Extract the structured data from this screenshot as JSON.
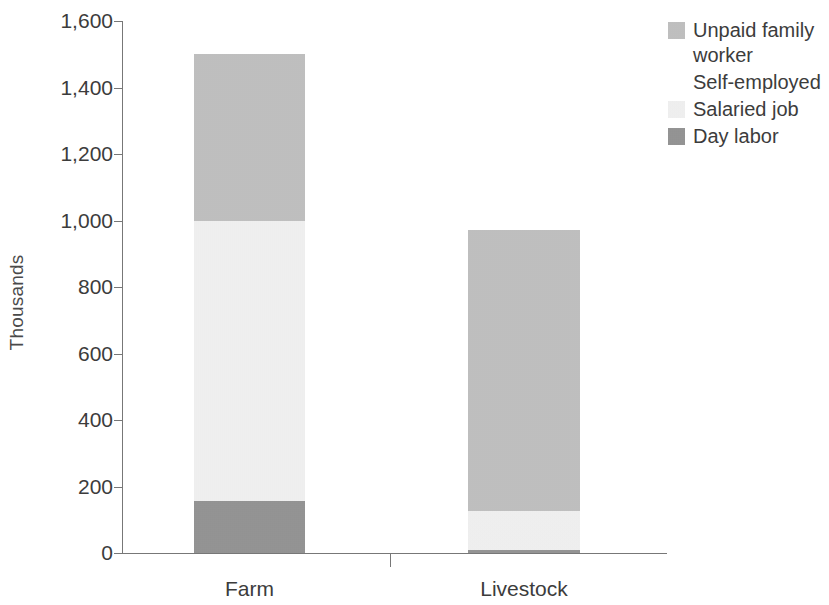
{
  "chart_data": {
    "type": "bar",
    "subtype": "stacked-vertical",
    "title": "",
    "subtitle": "",
    "xlabel": "",
    "ylabel": "Thousands",
    "categories": [
      "Farm",
      "Livestock"
    ],
    "series": [
      {
        "name": "Unpaid family worker",
        "color": "#bdbdbd",
        "values": [
          500,
          845
        ]
      },
      {
        "name": "Self-employed",
        "color": "#ffffff",
        "values": [
          0,
          0
        ]
      },
      {
        "name": "Salaried job",
        "color": "#f4f4f4",
        "values": [
          845,
          115
        ]
      },
      {
        "name": "Day labor",
        "color": "#8c8c8c",
        "values": [
          155,
          10
        ]
      }
    ],
    "stack_order_bottom_to_top": [
      "Day labor",
      "Salaried job",
      "Self-employed",
      "Unpaid family worker"
    ],
    "totals": [
      1500,
      970
    ],
    "segment_boundaries": {
      "Farm": [
        0,
        155,
        1000,
        1000,
        1500
      ],
      "Livestock": [
        0,
        10,
        125,
        125,
        970
      ]
    },
    "ylim": [
      0,
      1600
    ],
    "yticks": [
      0,
      200,
      400,
      600,
      800,
      1000,
      1200,
      1400,
      1600
    ],
    "ytick_labels": [
      "0",
      "200",
      "400",
      "600",
      "800",
      "1,000",
      "1,200",
      "1,400",
      "1,600"
    ],
    "grid": false,
    "legend_position": "right-top",
    "axis_color": "#777777",
    "text_color": "#3c3c3c",
    "background": "#ffffff"
  },
  "legend": {
    "items": [
      {
        "label": "Unpaid family\nworker",
        "swatch": "#bdbdbd",
        "swatch_visible": true
      },
      {
        "label": "Self-employed",
        "swatch": "#ffffff",
        "swatch_visible": false
      },
      {
        "label": "Salaried job",
        "swatch": "#f4f4f4",
        "swatch_visible": true
      },
      {
        "label": "Day labor",
        "swatch": "#8c8c8c",
        "swatch_visible": true
      }
    ]
  },
  "axis": {
    "y_title": "Thousands"
  }
}
